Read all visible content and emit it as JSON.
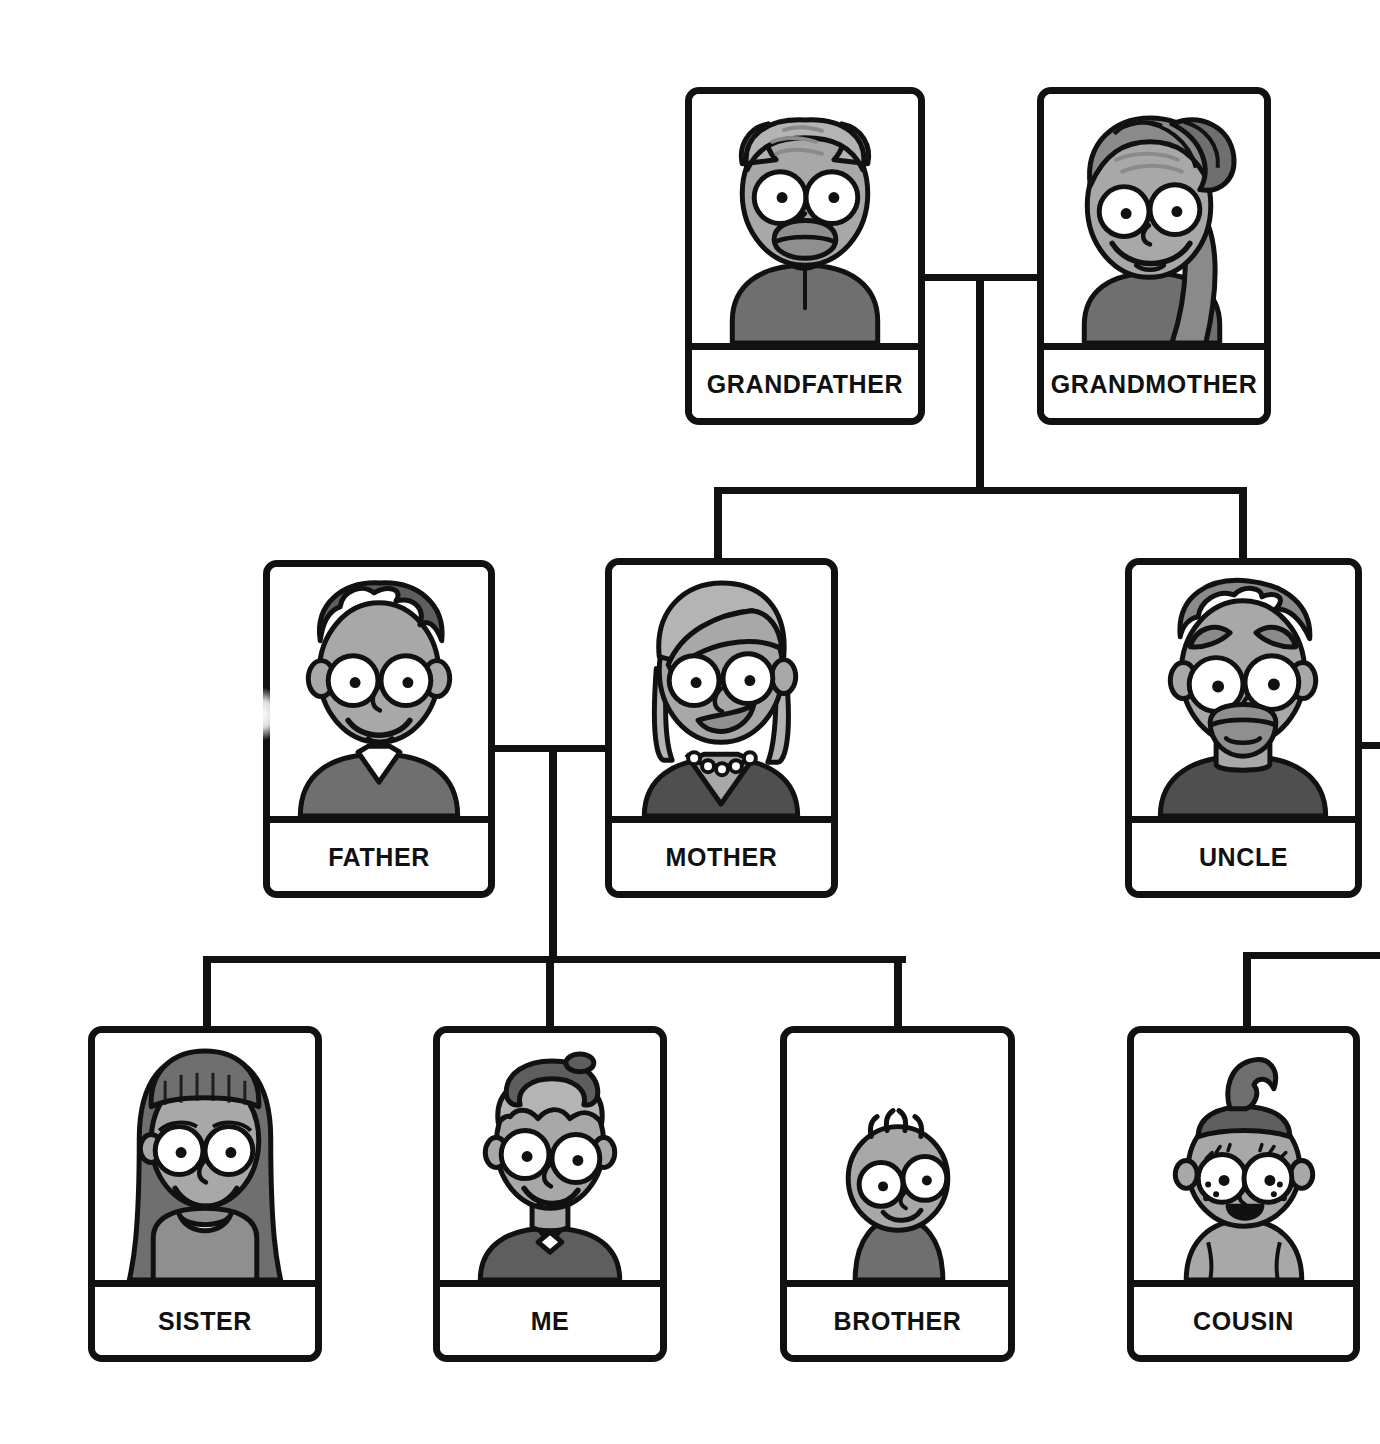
{
  "diagram": {
    "type": "family-tree",
    "palette": {
      "line": "#111111",
      "card_background": "#ffffff",
      "skin": "#a8a8a8",
      "skin_dark": "#8f8f8f",
      "hair_dark": "#5e5e5e",
      "hair_mid": "#8a8a8a",
      "hair_light": "#b4b4b4",
      "clothing_dark": "#6b6b6b",
      "clothing_mid": "#868686",
      "eye_white": "#ffffff"
    },
    "generations": [
      {
        "level": 1,
        "name": "grandparents",
        "members": [
          {
            "id": "grandfather",
            "label": "GRANDFATHER",
            "portrait": "elderly-man-bald-sides-hair",
            "x": 685,
            "y": 87,
            "w": 240,
            "h": 338
          },
          {
            "id": "grandmother",
            "label": "GRANDMOTHER",
            "portrait": "elderly-woman-hair-bun",
            "x": 1037,
            "y": 87,
            "w": 234,
            "h": 338
          }
        ]
      },
      {
        "level": 2,
        "name": "parents",
        "members": [
          {
            "id": "father",
            "label": "FATHER",
            "portrait": "man-dark-spiky-hair-collar",
            "x": 263,
            "y": 560,
            "w": 232,
            "h": 338
          },
          {
            "id": "mother",
            "label": "MOTHER",
            "portrait": "woman-side-swept-hair-necklace",
            "x": 605,
            "y": 558,
            "w": 233,
            "h": 340
          },
          {
            "id": "uncle",
            "label": "UNCLE",
            "portrait": "man-goatee-swept-hair",
            "x": 1125,
            "y": 558,
            "w": 237,
            "h": 340
          }
        ]
      },
      {
        "level": 3,
        "name": "children",
        "members": [
          {
            "id": "sister",
            "label": "SISTER",
            "portrait": "girl-long-dark-hair-bangs",
            "x": 88,
            "y": 1026,
            "w": 234,
            "h": 336
          },
          {
            "id": "me",
            "label": "ME",
            "portrait": "boy-cap-bowtie",
            "x": 433,
            "y": 1026,
            "w": 234,
            "h": 336
          },
          {
            "id": "brother",
            "label": "BROTHER",
            "portrait": "baby-small-tuft-hair",
            "x": 780,
            "y": 1026,
            "w": 235,
            "h": 336
          },
          {
            "id": "cousin",
            "label": "COUSIN",
            "portrait": "toddler-topknot-freckles",
            "x": 1127,
            "y": 1026,
            "w": 233,
            "h": 336
          }
        ]
      }
    ],
    "connectors": [
      {
        "id": "grandparents-marriage",
        "kind": "horizontal",
        "x": 925,
        "y": 274,
        "w": 112,
        "h": 7
      },
      {
        "id": "grandparents-descent",
        "kind": "vertical",
        "x": 976,
        "y": 274,
        "w": 8,
        "h": 216
      },
      {
        "id": "grandparents-sibling-bar",
        "kind": "horizontal",
        "x": 714,
        "y": 487,
        "w": 533,
        "h": 7
      },
      {
        "id": "bar-to-mother",
        "kind": "vertical",
        "x": 714,
        "y": 487,
        "w": 8,
        "h": 73
      },
      {
        "id": "bar-to-uncle",
        "kind": "vertical",
        "x": 1239,
        "y": 487,
        "w": 8,
        "h": 73
      },
      {
        "id": "parents-marriage",
        "kind": "horizontal",
        "x": 492,
        "y": 745,
        "w": 116,
        "h": 7
      },
      {
        "id": "parents-descent",
        "kind": "vertical",
        "x": 549,
        "y": 745,
        "w": 8,
        "h": 215
      },
      {
        "id": "children-sibling-bar",
        "kind": "horizontal",
        "x": 203,
        "y": 956,
        "w": 703,
        "h": 7
      },
      {
        "id": "bar-to-sister",
        "kind": "vertical",
        "x": 203,
        "y": 956,
        "w": 8,
        "h": 73
      },
      {
        "id": "bar-to-me",
        "kind": "vertical",
        "x": 546,
        "y": 956,
        "w": 8,
        "h": 73
      },
      {
        "id": "bar-to-brother",
        "kind": "vertical",
        "x": 894,
        "y": 956,
        "w": 8,
        "h": 73
      },
      {
        "id": "uncle-marriage-offscreen",
        "kind": "horizontal",
        "x": 1362,
        "y": 742,
        "w": 18,
        "h": 7
      },
      {
        "id": "cousin-sibling-bar-offscreen",
        "kind": "horizontal",
        "x": 1243,
        "y": 952,
        "w": 137,
        "h": 7
      },
      {
        "id": "bar-to-cousin",
        "kind": "vertical",
        "x": 1243,
        "y": 952,
        "w": 8,
        "h": 77
      }
    ],
    "notes": {
      "cropped_right_edge": "Uncle's spouse connector and cousin's sibling bar continue past the right edge of the image.",
      "glare_artifact": "A white highlight sits on the left border of the FATHER card."
    }
  }
}
